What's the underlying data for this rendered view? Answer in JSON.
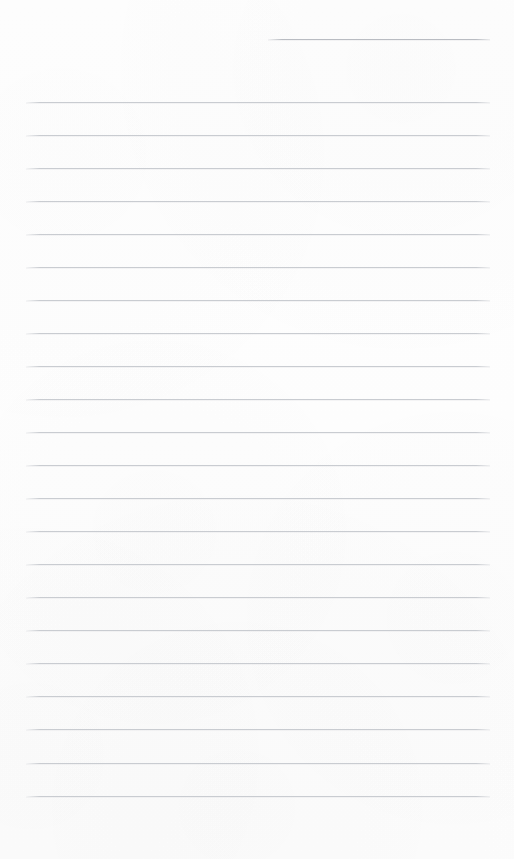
{
  "page": {
    "width": 514,
    "height": 859,
    "background_color": "#fdfdfd",
    "paper_tint": "#fefefe"
  },
  "rules": {
    "line_color": "#c9ccd1",
    "header_line_color": "#b9bcc2",
    "line_thickness_px": 1,
    "left_margin_px": 26,
    "right_margin_px": 490,
    "content_width_px": 464,
    "line_spacing_px": 33,
    "first_line_y_px": 102,
    "last_line_y_px": 796,
    "line_count": 22,
    "header_rule": {
      "y_px": 39,
      "x_start_px": 268,
      "x_end_px": 490,
      "width_px": 222,
      "alignment": "right"
    },
    "line_y_positions": [
      102,
      135,
      168,
      201,
      234,
      267,
      300,
      333,
      366,
      399,
      432,
      465,
      498,
      531,
      564,
      597,
      630,
      663,
      696,
      729,
      763,
      796
    ]
  },
  "content": {
    "written_text": "",
    "is_blank": true,
    "note": ""
  },
  "footer": {
    "blank_area_top_px": 797,
    "blank_area_height_px": 62
  }
}
